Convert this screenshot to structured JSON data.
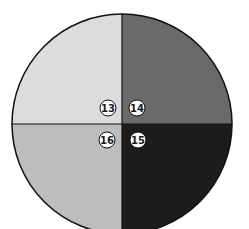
{
  "diagram": {
    "shape": "circle divided into four quadrants",
    "center": [
      122,
      124
    ],
    "radius": 110,
    "quadrants": [
      {
        "position": "top-left",
        "label": "13",
        "fill": "#dcdcdc",
        "badge_fill": "#ffffff",
        "badge_text": "#1a1a1a"
      },
      {
        "position": "top-right",
        "label": "14",
        "fill": "#6a6a6a",
        "badge_fill": "#ffffff",
        "badge_text": "#1a1a1a"
      },
      {
        "position": "bottom-right",
        "label": "15",
        "fill": "#1c1c1c",
        "badge_fill": "#ffffff",
        "badge_text": "#1a1a1a"
      },
      {
        "position": "bottom-left",
        "label": "16",
        "fill": "#bdbdbd",
        "badge_fill": "#ffffff",
        "badge_text": "#1a1a1a"
      }
    ],
    "outline_color": "#111111"
  }
}
